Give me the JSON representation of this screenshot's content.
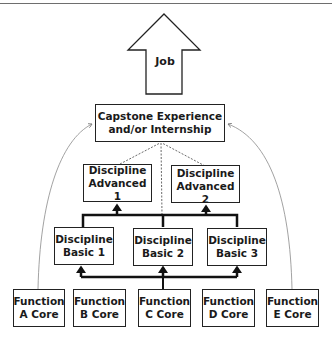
{
  "diagram": {
    "job": {
      "label": "Job"
    },
    "capstone": {
      "label": "Capstone Experience\nand/or Internship"
    },
    "advanced": [
      {
        "label": "Discipline\nAdvanced 1"
      },
      {
        "label": "Discipline\nAdvanced\n2"
      }
    ],
    "basic": [
      {
        "label": "Discipline\nBasic 1"
      },
      {
        "label": "Discipline\nBasic 2"
      },
      {
        "label": "Discipline\nBasic 3"
      }
    ],
    "functions": [
      {
        "label": "Function\nA Core"
      },
      {
        "label": "Function\nB Core"
      },
      {
        "label": "Function\nC Core"
      },
      {
        "label": "Function\nD Core"
      },
      {
        "label": "Function\nE Core"
      }
    ],
    "colors": {
      "stroke": "#222222",
      "dashed": "#555555",
      "curve": "#8a8a8a"
    }
  }
}
